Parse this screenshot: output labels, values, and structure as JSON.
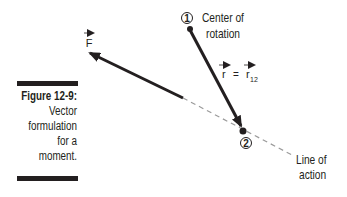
{
  "caption": {
    "title": "Figure 12-9:",
    "lines": [
      "Vector",
      "formulation",
      "for a",
      "moment."
    ]
  },
  "diagram": {
    "point1": {
      "marker": "1",
      "label_lines": [
        "Center of",
        "rotation"
      ]
    },
    "point2": {
      "marker": "2"
    },
    "force_label": "F",
    "r_label": {
      "lhs": "r",
      "equals": "=",
      "rhs": "r",
      "rhs_subscript": "12"
    },
    "line_of_action_label": [
      "Line of",
      "action"
    ],
    "colors": {
      "ink": "#231f20",
      "dashed": "#9a9a9a"
    }
  }
}
